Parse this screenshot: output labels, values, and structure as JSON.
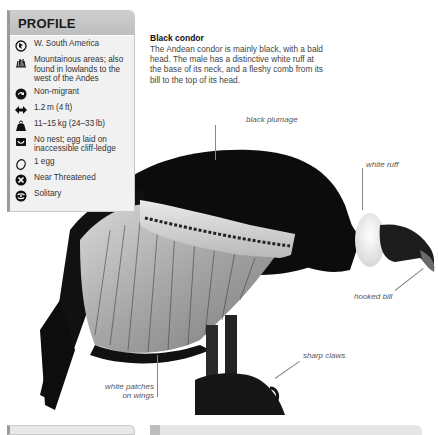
{
  "profile": {
    "title": "PROFILE",
    "items": [
      {
        "icon": "globe-icon",
        "text": "W. South America"
      },
      {
        "icon": "habitat-grass-icon",
        "text": "Mountainous areas; also found in lowlands to the west of the Andes"
      },
      {
        "icon": "migration-arrow-icon",
        "text": "Non-migrant"
      },
      {
        "icon": "wingspan-arrows-icon",
        "text": "1.2 m (4 ft)"
      },
      {
        "icon": "weight-icon",
        "text": "11–15 kg (24–33 lb)"
      },
      {
        "icon": "nest-icon",
        "text": "No nest; egg laid on inaccessible cliff-ledge"
      },
      {
        "icon": "egg-icon",
        "text": "1 egg"
      },
      {
        "icon": "conservation-status-icon",
        "text": "Near Threatened"
      },
      {
        "icon": "social-behavior-icon",
        "text": "Solitary"
      }
    ]
  },
  "intro": {
    "title": "Black condor",
    "body": "The Andean condor is mainly black, with a bald head. The male has a distinctive white ruff at the base of its neck, and a fleshy comb from its bill to the top of its head."
  },
  "annotations": {
    "black_plumage": "black plumage",
    "white_ruff": "white ruff",
    "hooked_bill": "hooked bill",
    "sharp_claws": "sharp claws",
    "white_patches_line1": "white patches",
    "white_patches_line2": "on wings"
  },
  "colors": {
    "profile_bg": "#f1f1f1",
    "profile_header": "#c6c6c6",
    "profile_accent": "#9a9a9a",
    "bird_black": "#0c0c0c",
    "wing_grey": "#a9a9a9"
  }
}
